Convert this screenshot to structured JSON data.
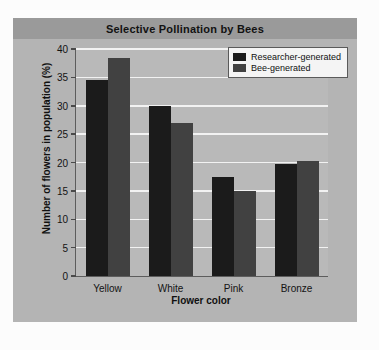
{
  "chart_data": {
    "type": "bar",
    "title": "Selective Pollination by Bees",
    "xlabel": "Flower color",
    "ylabel": "Number of flowers in population (%)",
    "categories": [
      "Yellow",
      "White",
      "Pink",
      "Bronze"
    ],
    "series": [
      {
        "name": "Researcher-generated",
        "color": "#1b1b1b",
        "values": [
          34.5,
          30.0,
          17.5,
          19.7
        ]
      },
      {
        "name": "Bee-generated",
        "color": "#414141",
        "values": [
          38.5,
          27.0,
          15.0,
          20.2
        ]
      }
    ],
    "ylim": [
      0,
      40
    ],
    "yticks": [
      0,
      5,
      10,
      15,
      20,
      25,
      30,
      35,
      40
    ],
    "ytick_labels": [
      "0",
      "5",
      "10",
      "15",
      "20",
      "25",
      "30",
      "35",
      "40"
    ],
    "grid": true,
    "legend_position": "top-right"
  },
  "panel": {
    "background_color": "#b4b4b4",
    "title_bar_color": "#9a9a9a",
    "plot_background_color": "#b9b9b9",
    "gridline_color": "#f2f2f2"
  }
}
